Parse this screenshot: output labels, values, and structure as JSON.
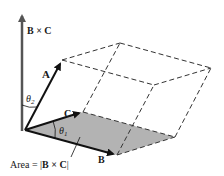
{
  "diagram": {
    "labels": {
      "cross_axis": "B × C",
      "vector_a": "A",
      "vector_b": "B",
      "vector_c": "C",
      "theta1": "θ",
      "theta1_sub": "1",
      "theta2": "θ",
      "theta2_sub": "2",
      "area_prefix": "Area = |",
      "area_expr": "B × C",
      "area_suffix": "|"
    },
    "colors": {
      "vectors": "#111111",
      "cross_axis": "#555555",
      "base_face": "#b3b3b3",
      "dashed_edges": "#333333",
      "background": "#ffffff"
    }
  }
}
